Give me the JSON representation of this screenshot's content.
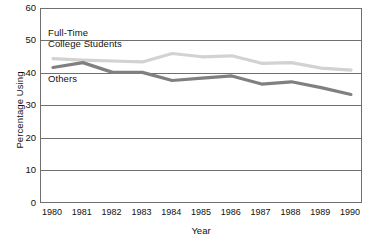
{
  "chart_data": {
    "type": "line",
    "title": "",
    "title_sliver_note": "",
    "xlabel": "Year",
    "ylabel": "Percentage Using",
    "categories": [
      1980,
      1981,
      1982,
      1983,
      1984,
      1985,
      1986,
      1987,
      1988,
      1989,
      1990
    ],
    "x": [
      "1980",
      "1981",
      "1982",
      "1983",
      "1984",
      "1985",
      "1986",
      "1987",
      "1988",
      "1989",
      "1990"
    ],
    "xlim": [
      1980,
      1990
    ],
    "ylim": [
      0,
      60
    ],
    "yticks": [
      "0",
      "10",
      "20",
      "30",
      "40",
      "50",
      "60"
    ],
    "ytick_values": [
      0,
      10,
      20,
      30,
      40,
      50,
      60
    ],
    "grid": true,
    "grid_axis": "y",
    "legend_position": "inline-annotations",
    "series": [
      {
        "name": "Full-Time College Students",
        "label_line_1": "Full-Time",
        "label_line_2": "College Students",
        "color": "#d2d2d2",
        "values": [
          44.7,
          44.3,
          44.0,
          43.7,
          46.3,
          45.3,
          45.6,
          43.3,
          43.5,
          41.8,
          41.2
        ]
      },
      {
        "name": "Others",
        "label_line_1": "Others",
        "label_line_2": "",
        "color": "#808080",
        "values": [
          42.0,
          43.5,
          40.5,
          40.5,
          38.0,
          38.7,
          39.4,
          36.9,
          37.6,
          35.8,
          33.7
        ]
      }
    ],
    "annotations": [
      {
        "text": "Full-Time",
        "series": "Full-Time College Students"
      },
      {
        "text": "College Students",
        "series": "Full-Time College Students"
      },
      {
        "text": "Others",
        "series": "Others"
      }
    ]
  },
  "axes": {
    "y_title": "Percentage Using",
    "x_title": "Year"
  },
  "colors": {
    "series_light": "#d2d2d2",
    "series_dark": "#808080",
    "axis": "#6f6f6f",
    "text": "#111111",
    "background": "#ffffff"
  }
}
